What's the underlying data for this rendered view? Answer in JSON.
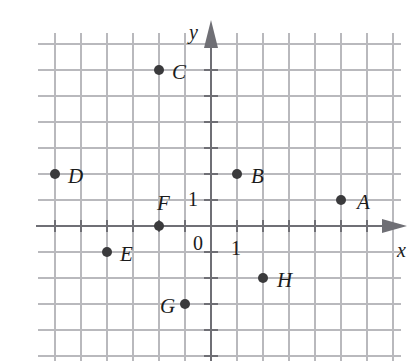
{
  "figure": {
    "kind": "coordinate-plane",
    "background_color": "#ffffff",
    "grid_color": "#b9b9bd",
    "axis_color": "#6f6f75",
    "point_color": "#3a3a3c",
    "label_color": "#1b1b1b"
  },
  "axes": {
    "x_axis_label": "x",
    "y_axis_label": "y",
    "origin_label": "0",
    "x_unit_label": "1",
    "y_unit_label": "1",
    "x_range": [
      -7,
      7
    ],
    "y_range": [
      -6,
      8
    ],
    "grid_step": 1,
    "grid_on": true,
    "x_arrow": "right",
    "y_arrow": "up"
  },
  "chart_data": {
    "type": "scatter",
    "title": "",
    "xlabel": "x",
    "ylabel": "y",
    "xlim": [
      -7,
      7
    ],
    "ylim": [
      -6,
      8
    ],
    "grid": true,
    "legend": "none",
    "tick_labels": {
      "x": [
        "0",
        "1"
      ],
      "y": [
        "1"
      ]
    },
    "points": [
      {
        "label": "A",
        "x": 5,
        "y": 1,
        "label_dx": 16,
        "label_dy": -8
      },
      {
        "label": "B",
        "x": 1,
        "y": 2,
        "label_dx": 14,
        "label_dy": -8
      },
      {
        "label": "C",
        "x": -2,
        "y": 6,
        "label_dx": 13,
        "label_dy": -8
      },
      {
        "label": "D",
        "x": -6,
        "y": 2,
        "label_dx": 13,
        "label_dy": -8
      },
      {
        "label": "E",
        "x": -4,
        "y": -1,
        "label_dx": 13,
        "label_dy": -8
      },
      {
        "label": "F",
        "x": -2,
        "y": 0,
        "label_dx": -2,
        "label_dy": -33
      },
      {
        "label": "G",
        "x": -1,
        "y": -3,
        "label_dx": -25,
        "label_dy": -8
      },
      {
        "label": "H",
        "x": 2,
        "y": -2,
        "label_dx": 14,
        "label_dy": -8
      }
    ]
  },
  "geometry": {
    "origin_px": [
      211,
      226
    ],
    "step_px": 26,
    "point_radius_px": 5
  }
}
